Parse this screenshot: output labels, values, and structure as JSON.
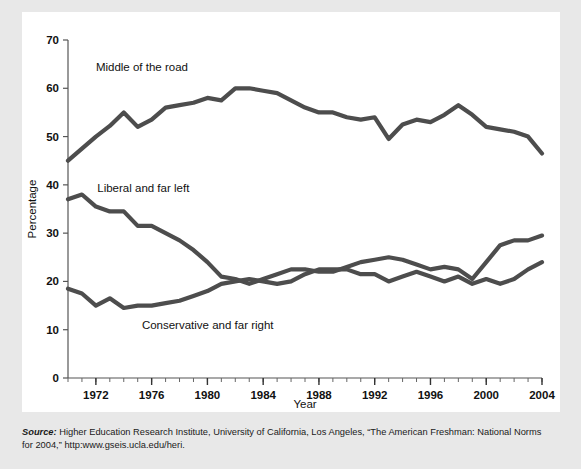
{
  "figure": {
    "y_axis_title": "Percentage",
    "x_axis_title": "Year",
    "source_prefix": "Source:",
    "source_text": " Higher Education Research Institute, University of California, Los Angeles, “The American Freshman: National Norms for 2004,” http:www.gseis.ucla.edu/heri."
  },
  "chart_data": {
    "type": "line",
    "title": "",
    "xlabel": "Year",
    "ylabel": "Percentage",
    "xlim": [
      1970,
      2004
    ],
    "ylim": [
      0,
      70
    ],
    "yticks": [
      0,
      10,
      20,
      30,
      40,
      50,
      60,
      70
    ],
    "xticks": [
      1972,
      1976,
      1980,
      1984,
      1988,
      1992,
      1996,
      2000,
      2004
    ],
    "minor_xticks_every": 1,
    "grid": false,
    "legend_position": "inline-labels",
    "line_color": "#4d4d4d",
    "x": [
      1970,
      1971,
      1972,
      1973,
      1974,
      1975,
      1976,
      1977,
      1978,
      1979,
      1980,
      1981,
      1982,
      1983,
      1984,
      1985,
      1986,
      1987,
      1988,
      1989,
      1990,
      1991,
      1992,
      1993,
      1994,
      1995,
      1996,
      1997,
      1998,
      1999,
      2000,
      2001,
      2002,
      2003,
      2004
    ],
    "series": [
      {
        "name": "Middle of the road",
        "label": "Middle of the road",
        "label_x": 1972.0,
        "label_y": 63.5,
        "values": [
          45.0,
          47.5,
          50.0,
          52.2,
          55.0,
          52.0,
          53.5,
          56.0,
          56.5,
          57.0,
          58.0,
          57.5,
          60.0,
          60.0,
          59.5,
          59.0,
          57.5,
          56.0,
          55.0,
          55.0,
          54.0,
          53.5,
          54.0,
          49.5,
          52.5,
          53.5,
          53.0,
          54.5,
          56.5,
          54.5,
          52.0,
          51.5,
          51.0,
          50.0,
          46.5
        ]
      },
      {
        "name": "Liberal and far left",
        "label": "Liberal and far left",
        "label_x": 1972.1,
        "label_y": 38.5,
        "values": [
          37.0,
          38.0,
          35.5,
          34.5,
          34.5,
          31.5,
          31.5,
          30.0,
          28.5,
          26.5,
          24.0,
          21.0,
          20.5,
          19.5,
          20.5,
          21.5,
          22.5,
          22.5,
          22.0,
          22.0,
          23.0,
          24.0,
          24.5,
          25.0,
          24.5,
          23.5,
          22.5,
          23.0,
          22.5,
          20.5,
          24.0,
          27.5,
          28.5,
          28.5,
          29.5
        ]
      },
      {
        "name": "Conservative and far right",
        "label": "Conservative and far right",
        "label_x": 1975.3,
        "label_y": 10.2,
        "values": [
          18.5,
          17.5,
          15.0,
          16.5,
          14.5,
          15.0,
          15.0,
          15.5,
          16.0,
          17.0,
          18.0,
          19.5,
          20.0,
          20.5,
          20.0,
          19.5,
          20.0,
          21.5,
          22.5,
          22.5,
          22.5,
          21.5,
          21.5,
          20.0,
          21.0,
          22.0,
          21.0,
          20.0,
          21.0,
          19.5,
          20.5,
          19.5,
          20.5,
          22.5,
          24.0
        ]
      }
    ]
  }
}
